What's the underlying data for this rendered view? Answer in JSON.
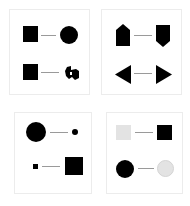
{
  "panels": [
    {
      "name": "panel-shape-change",
      "rows": [
        {
          "left": "filled-square",
          "right": "filled-circle"
        },
        {
          "left": "filled-square",
          "right": "irregular-blob"
        }
      ]
    },
    {
      "name": "panel-orientation-change",
      "rows": [
        {
          "left": "pentagon-arrow-up",
          "right": "pentagon-arrow-down"
        },
        {
          "left": "triangle-left",
          "right": "triangle-right"
        }
      ]
    },
    {
      "name": "panel-size-change",
      "rows": [
        {
          "left": "large-circle",
          "right": "small-circle"
        },
        {
          "left": "small-square",
          "right": "large-square"
        }
      ]
    },
    {
      "name": "panel-color-change",
      "rows": [
        {
          "left": "light-gray-square",
          "right": "black-square"
        },
        {
          "left": "black-circle",
          "right": "light-gray-circle"
        }
      ]
    }
  ],
  "colors": {
    "dark": "#000000",
    "light": "#e3e3e3",
    "connector": "#9a9a9a",
    "border": "#ececec"
  }
}
